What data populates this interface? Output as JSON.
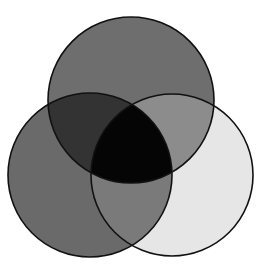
{
  "diagram": {
    "type": "venn",
    "sets": [
      {
        "id": "top",
        "cx": 131,
        "cy": 100,
        "r": 83,
        "fill": "#6e6e6e"
      },
      {
        "id": "left",
        "cx": 90,
        "cy": 175,
        "r": 82,
        "fill": "#6a6a6a"
      },
      {
        "id": "right",
        "cx": 172,
        "cy": 175,
        "r": 81,
        "fill": "#e6e6e6"
      }
    ],
    "regions": {
      "top_only": "#6e6e6e",
      "left_only": "#6a6a6a",
      "right_only": "#e6e6e6",
      "top_left": "#333333",
      "top_right": "#8c8c8c",
      "left_right": "#7a7a7a",
      "all_three": "#050505"
    },
    "stroke": "#111111",
    "background": "#ffffff"
  }
}
